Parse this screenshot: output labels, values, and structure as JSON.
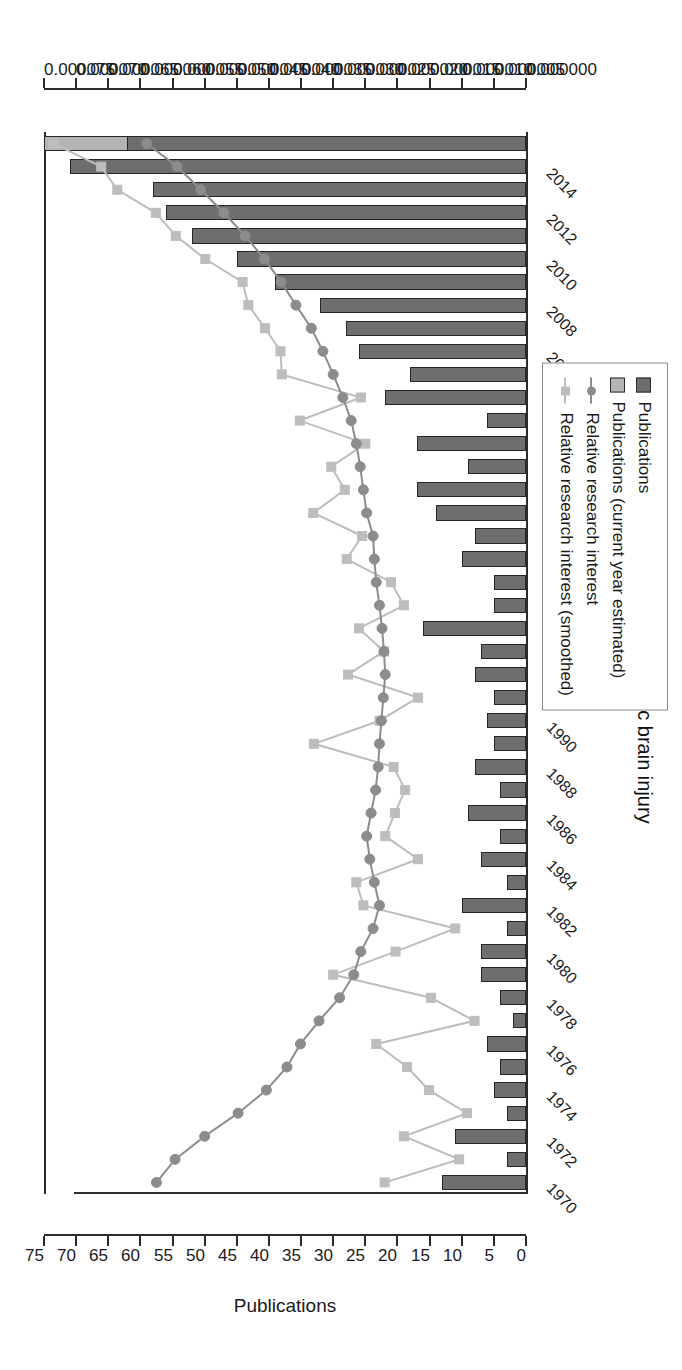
{
  "title": "Topic: Sleep in traumatic brain injury",
  "axes": {
    "publications": {
      "label": "Publications",
      "ticks": [
        0,
        5,
        10,
        15,
        20,
        25,
        30,
        35,
        40,
        45,
        50,
        55,
        60,
        65,
        70,
        75
      ],
      "min": 0,
      "max": 75
    },
    "relative_research_interest": {
      "label": "Relative research interest",
      "ticks": [
        "0.000000",
        "0.000005",
        "0.000010",
        "0.000015",
        "0.000020",
        "0.000025",
        "0.000030",
        "0.000035",
        "0.000040",
        "0.000045",
        "0.000050",
        "0.000055",
        "0.000060",
        "0.000065",
        "0.000070",
        "0.000075"
      ],
      "min": 0,
      "max": 7.5e-05
    }
  },
  "legend": {
    "position": "right",
    "items": [
      {
        "label": "Publications",
        "swatch": "dark-square",
        "color": "#6e6e6e"
      },
      {
        "label": "Publications (current year estimated)",
        "swatch": "light-square",
        "color": "#b4b4b4"
      },
      {
        "label": "Relative research interest",
        "swatch": "line-marker-dark",
        "color": "#8c8c8c"
      },
      {
        "label": "Relative research interest (smoothed)",
        "swatch": "line-marker-light",
        "color": "#bdbdbd"
      }
    ]
  },
  "chart_data": {
    "type": "bar",
    "title": "Topic: Sleep in traumatic brain injury",
    "xlabel": "",
    "ylabel": "Publications",
    "y2label": "Relative research interest",
    "ylim": [
      0,
      75
    ],
    "y2lim": [
      0,
      7.5e-05
    ],
    "grid": false,
    "legend_position": "right",
    "orientation": "rotated-90-horizontal-bars",
    "categories": [
      1970,
      1971,
      1972,
      1973,
      1974,
      1975,
      1976,
      1977,
      1978,
      1979,
      1980,
      1981,
      1982,
      1983,
      1984,
      1985,
      1986,
      1987,
      1988,
      1989,
      1990,
      1991,
      1992,
      1993,
      1994,
      1995,
      1996,
      1997,
      1998,
      1999,
      2000,
      2001,
      2002,
      2003,
      2004,
      2005,
      2006,
      2007,
      2008,
      2009,
      2010,
      2011,
      2012,
      2013,
      2014,
      2015
    ],
    "tick_labels_shown": [
      1970,
      1972,
      1974,
      1976,
      1978,
      1980,
      1982,
      1984,
      1986,
      1988,
      1990,
      1992,
      1994,
      1996,
      1998,
      2000,
      2002,
      2004,
      2006,
      2008,
      2010,
      2012,
      2014
    ],
    "series": [
      {
        "name": "Publications",
        "type": "bar",
        "color": "#6e6e6e",
        "values": [
          13,
          3,
          11,
          3,
          5,
          4,
          6,
          2,
          4,
          7,
          7,
          3,
          10,
          3,
          7,
          4,
          9,
          4,
          8,
          5,
          6,
          5,
          8,
          7,
          16,
          5,
          5,
          10,
          8,
          14,
          17,
          9,
          17,
          6,
          22,
          18,
          26,
          28,
          32,
          39,
          45,
          52,
          56,
          58,
          71,
          75
        ]
      },
      {
        "name": "Publications (current year estimated)",
        "type": "bar-estimated-portion",
        "color": "#b4b4b4",
        "year": 2015,
        "estimated_from": 62,
        "value": 75
      },
      {
        "name": "Relative research interest",
        "type": "line",
        "color": "#8c8c8c",
        "marker": "circle",
        "values": [
          5.75e-05,
          5.46e-05,
          5e-05,
          4.48e-05,
          4.04e-05,
          3.72e-05,
          3.51e-05,
          3.22e-05,
          2.9e-05,
          2.68e-05,
          2.57e-05,
          2.38e-05,
          2.28e-05,
          2.36e-05,
          2.43e-05,
          2.48e-05,
          2.41e-05,
          2.34e-05,
          2.3e-05,
          2.28e-05,
          2.25e-05,
          2.22e-05,
          2.19e-05,
          2.21e-05,
          2.24e-05,
          2.28e-05,
          2.33e-05,
          2.36e-05,
          2.38e-05,
          2.48e-05,
          2.53e-05,
          2.58e-05,
          2.64e-05,
          2.72e-05,
          2.85e-05,
          3e-05,
          3.16e-05,
          3.34e-05,
          3.58e-05,
          3.81e-05,
          4.07e-05,
          4.37e-05,
          4.7e-05,
          5.06e-05,
          5.43e-05,
          5.9e-05
        ]
      },
      {
        "name": "Relative research interest (smoothed)",
        "type": "line",
        "color": "#bdbdbd",
        "marker": "square",
        "values": [
          2.2e-05,
          1.04e-05,
          1.9e-05,
          9.2e-06,
          1.51e-05,
          1.85e-05,
          2.33e-05,
          8e-06,
          1.48e-05,
          3e-05,
          2.03e-05,
          1.1e-05,
          2.53e-05,
          2.64e-05,
          1.68e-05,
          2.19e-05,
          2.04e-05,
          1.88e-05,
          2.06e-05,
          3.3e-05,
          2.28e-05,
          1.68e-05,
          2.77e-05,
          2.21e-05,
          2.6e-05,
          1.9e-05,
          2.1e-05,
          2.79e-05,
          2.55e-05,
          3.31e-05,
          2.82e-05,
          3.03e-05,
          2.5e-05,
          3.52e-05,
          2.57e-05,
          3.8e-05,
          3.82e-05,
          4.06e-05,
          4.32e-05,
          4.41e-05,
          4.99e-05,
          5.45e-05,
          5.76e-05,
          6.36e-05,
          6.61e-05,
          7.35e-05
        ]
      }
    ]
  }
}
